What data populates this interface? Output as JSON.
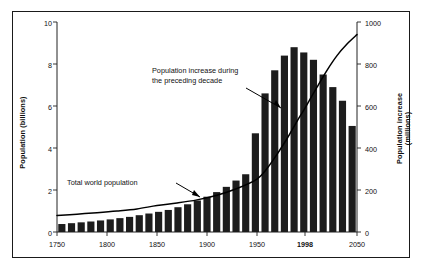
{
  "figure": {
    "background_color": "#ffffff",
    "frame_color": "#1a1a1a",
    "bar_color": "#1c1c1c",
    "line_color": "#000000"
  },
  "axes": {
    "left": {
      "title": "Population (billions)",
      "ticks": [
        0,
        2,
        4,
        6,
        8,
        10
      ],
      "tick_labels": [
        "0",
        "2",
        "4",
        "6",
        "8",
        "10"
      ],
      "min": 0,
      "max": 10
    },
    "right": {
      "title_line1": "Population increase",
      "title_line2": "(millions)",
      "ticks": [
        0,
        200,
        400,
        600,
        800,
        1000
      ],
      "tick_labels": [
        "0",
        "200",
        "400",
        "600",
        "800",
        "1000"
      ],
      "min": 0,
      "max": 1000
    },
    "bottom": {
      "tick_labels": [
        "1750",
        "1800",
        "1850",
        "1900",
        "1950",
        "1998",
        "2050"
      ],
      "bold_tick": "1998",
      "min": 1750,
      "max": 2050
    }
  },
  "annotations": {
    "increase_line1": "Population increase during",
    "increase_line2": "the preceding decade",
    "total_population": "Total world population"
  },
  "chart_data": {
    "type": "bar",
    "title": "",
    "subtitle": "",
    "xlabel": "",
    "ylabel": "Population (billions)",
    "y2label": "Population increase (millions)",
    "xlim": [
      1750,
      2050
    ],
    "ylim": [
      0,
      10
    ],
    "y2lim": [
      0,
      1000
    ],
    "grid": false,
    "legend_position": "none",
    "x_tick_labels": [
      "1750",
      "1800",
      "1850",
      "1900",
      "1950",
      "1998",
      "2050"
    ],
    "series": [
      {
        "name": "Population increase during the preceding decade",
        "type": "bar",
        "axis": "right",
        "unit": "millions",
        "categories": [
          "1750",
          "1760",
          "1770",
          "1780",
          "1790",
          "1800",
          "1810",
          "1820",
          "1830",
          "1840",
          "1850",
          "1860",
          "1870",
          "1880",
          "1890",
          "1900",
          "1910",
          "1920",
          "1930",
          "1940",
          "1950",
          "1960",
          "1970",
          "1980",
          "1990",
          "2000",
          "2010",
          "2020",
          "2030",
          "2040",
          "2050"
        ],
        "values": [
          38,
          42,
          46,
          50,
          55,
          60,
          66,
          72,
          80,
          88,
          96,
          105,
          118,
          132,
          150,
          168,
          190,
          215,
          245,
          275,
          470,
          660,
          770,
          840,
          880,
          855,
          820,
          750,
          690,
          625,
          505
        ]
      },
      {
        "name": "Total world population",
        "type": "line",
        "axis": "left",
        "unit": "billions",
        "x": [
          1750,
          1770,
          1790,
          1810,
          1830,
          1850,
          1870,
          1890,
          1910,
          1930,
          1950,
          1960,
          1970,
          1980,
          1990,
          1998,
          2010,
          2020,
          2030,
          2040,
          2050
        ],
        "values": [
          0.79,
          0.85,
          0.92,
          1.0,
          1.1,
          1.26,
          1.38,
          1.53,
          1.75,
          2.07,
          2.52,
          3.02,
          3.7,
          4.44,
          5.27,
          5.9,
          6.9,
          7.7,
          8.4,
          8.95,
          9.4
        ]
      }
    ]
  }
}
